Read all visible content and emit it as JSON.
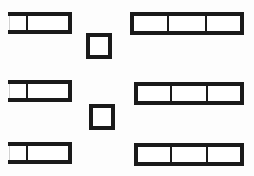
{
  "document": {
    "title": "Rectangle Partition Diagram",
    "background_color": "#fdfdfd",
    "stroke_color": "#1a1a1a",
    "fill_color": "#ffffff",
    "width": 254,
    "height": 176
  },
  "chart_data": {
    "type": "diagram",
    "groups": [
      {
        "name": "left-column",
        "label": "Two-cell wide rectangles",
        "count": 3,
        "cells_per_shape": 2,
        "shapes": [
          {
            "id": "left-shape-1",
            "x": 8,
            "y": 12,
            "width": 64,
            "height": 22,
            "divider_fractions": [
              0.3
            ],
            "stroke_width": 3.6,
            "left_edge_thin": true
          },
          {
            "id": "left-shape-2",
            "x": 8,
            "y": 80,
            "width": 64,
            "height": 22,
            "divider_fractions": [
              0.3
            ],
            "stroke_width": 3.6,
            "left_edge_thin": true
          },
          {
            "id": "left-shape-3",
            "x": 8,
            "y": 142,
            "width": 64,
            "height": 22,
            "divider_fractions": [
              0.3
            ],
            "stroke_width": 3.6,
            "left_edge_thin": true
          }
        ]
      },
      {
        "name": "middle-column",
        "label": "Small squares",
        "count": 2,
        "cells_per_shape": 1,
        "shapes": [
          {
            "id": "square-1",
            "x": 86,
            "y": 33,
            "width": 26,
            "height": 26,
            "divider_fractions": [],
            "stroke_width": 3.6,
            "left_edge_thin": false
          },
          {
            "id": "square-2",
            "x": 89,
            "y": 104,
            "width": 26,
            "height": 26,
            "divider_fractions": [],
            "stroke_width": 3.6,
            "left_edge_thin": false
          }
        ]
      },
      {
        "name": "right-column",
        "label": "Three-cell long rectangles",
        "count": 3,
        "cells_per_shape": 3,
        "shapes": [
          {
            "id": "right-shape-1",
            "x": 130,
            "y": 12,
            "width": 114,
            "height": 23,
            "divider_fractions": [
              0.335,
              0.665
            ],
            "stroke_width": 3.6,
            "left_edge_thin": false
          },
          {
            "id": "right-shape-2",
            "x": 134,
            "y": 82,
            "width": 110,
            "height": 23,
            "divider_fractions": [
              0.335,
              0.665
            ],
            "stroke_width": 3.6,
            "left_edge_thin": false
          },
          {
            "id": "right-shape-3",
            "x": 134,
            "y": 143,
            "width": 110,
            "height": 23,
            "divider_fractions": [
              0.335,
              0.665
            ],
            "stroke_width": 3.6,
            "left_edge_thin": false
          }
        ]
      }
    ],
    "totals": {
      "shape_count": 8,
      "left_column_count": 3,
      "middle_column_count": 2,
      "right_column_count": 3,
      "total_cells": 17
    },
    "annotations": [],
    "legend": [],
    "grid": false
  }
}
